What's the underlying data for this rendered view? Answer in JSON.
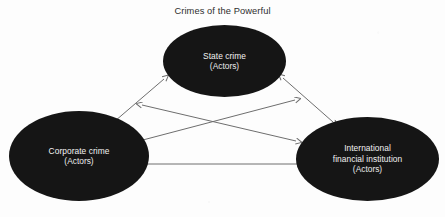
{
  "diagram": {
    "title": "Crimes of the Powerful",
    "type": "relationship-diagram",
    "background_color": "#fdfdfd",
    "node_fill_color": "#151515",
    "node_text_color": "#f2f2f2",
    "arrow_color": "#6e6e6e",
    "nodes": [
      {
        "id": "state-crime",
        "label": "State crime",
        "sublabel": "(Actors)",
        "position": "top-center"
      },
      {
        "id": "corporate-crime",
        "label": "Corporate crime",
        "sublabel": "(Actors)",
        "position": "bottom-left"
      },
      {
        "id": "international-financial-institution",
        "label_line1": "International",
        "label_line2": "financial institution",
        "sublabel": "(Actors)",
        "position": "bottom-right"
      }
    ],
    "connections": [
      {
        "id": "corporate-to-state",
        "from": "corporate-crime",
        "to": "state-crime",
        "style": "double-headed-arrow"
      },
      {
        "id": "state-to-ifi",
        "from": "state-crime",
        "to": "international-financial-institution",
        "style": "double-headed-arrow"
      },
      {
        "id": "corporate-upper-to-ifi-lower",
        "from": "corporate-crime",
        "to": "international-financial-institution",
        "style": "double-headed-arrow"
      },
      {
        "id": "corporate-lower-to-ifi-upper",
        "from": "corporate-crime",
        "to": "international-financial-institution",
        "style": "double-headed-arrow"
      },
      {
        "id": "corporate-to-ifi-horizontal",
        "from": "corporate-crime",
        "to": "international-financial-institution",
        "style": "double-headed-arrow"
      }
    ]
  }
}
